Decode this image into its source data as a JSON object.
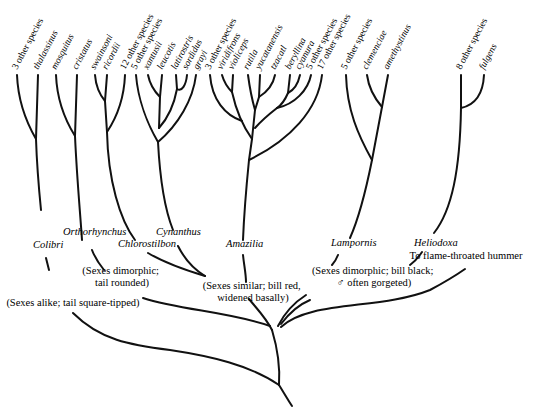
{
  "diagram": {
    "type": "phylogenetic-tree",
    "tips": [
      {
        "label": "3 other species",
        "italic": false,
        "x": 17
      },
      {
        "label": "thalassinus",
        "italic": true,
        "x": 38
      },
      {
        "label": "mosquitus",
        "italic": true,
        "x": 56
      },
      {
        "label": "cristatus",
        "italic": true,
        "x": 77
      },
      {
        "label": "swainsoni",
        "italic": true,
        "x": 95
      },
      {
        "label": "ricordii",
        "italic": true,
        "x": 107
      },
      {
        "label": "12 other species",
        "italic": false,
        "x": 125
      },
      {
        "label": "5 other species",
        "italic": false,
        "x": 136
      },
      {
        "label": "xantusii",
        "italic": true,
        "x": 148
      },
      {
        "label": "leucotis",
        "italic": true,
        "x": 162
      },
      {
        "label": "latirostris",
        "italic": true,
        "x": 176
      },
      {
        "label": "sordidus",
        "italic": true,
        "x": 187
      },
      {
        "label": "grayi",
        "italic": true,
        "x": 198
      },
      {
        "label": "3 other species",
        "italic": false,
        "x": 210
      },
      {
        "label": "viridifrons",
        "italic": true,
        "x": 222
      },
      {
        "label": "violiceps",
        "italic": true,
        "x": 233
      },
      {
        "label": "rutila",
        "italic": true,
        "x": 248
      },
      {
        "label": "yucatanensis",
        "italic": true,
        "x": 260
      },
      {
        "label": "tzacatl",
        "italic": true,
        "x": 275
      },
      {
        "label": "beryllina",
        "italic": true,
        "x": 290
      },
      {
        "label": "cyanura",
        "italic": true,
        "x": 300
      },
      {
        "label": "5 other species",
        "italic": false,
        "x": 311
      },
      {
        "label": "17 other species",
        "italic": false,
        "x": 322
      },
      {
        "label": "5 other species",
        "italic": false,
        "x": 346
      },
      {
        "label": "clemenciae",
        "italic": true,
        "x": 367
      },
      {
        "label": "amethystinus",
        "italic": true,
        "x": 388
      },
      {
        "label": "8 other species",
        "italic": false,
        "x": 461
      },
      {
        "label": "fulgens",
        "italic": true,
        "x": 484
      }
    ],
    "genera": [
      {
        "label": "Colibri",
        "x": 33,
        "y": 248
      },
      {
        "label": "Orthorhynchus",
        "x": 63,
        "y": 235
      },
      {
        "label": "Chlorostilbon",
        "x": 118,
        "y": 247
      },
      {
        "label": "Cynanthus",
        "x": 156,
        "y": 235
      },
      {
        "label": "Amazilia",
        "x": 226,
        "y": 247
      },
      {
        "label": "Lampornis",
        "x": 331,
        "y": 246
      },
      {
        "label": "Heliodoxa",
        "x": 414,
        "y": 246
      }
    ],
    "notes": [
      {
        "lines": [
          "(Sexes dimorphic;",
          "tail rounded)"
        ],
        "x": 122,
        "y": 274
      },
      {
        "lines": [
          "(Sexes similar; bill red,",
          "widened basally)"
        ],
        "x": 253,
        "y": 289
      },
      {
        "lines": [
          "(Sexes dimorphic; bill black;",
          "♂ often gorgeted)"
        ],
        "x": 374,
        "y": 274
      },
      {
        "lines": [
          "(Sexes alike; tail square-tipped)"
        ],
        "x": 73,
        "y": 306
      },
      {
        "lines": [
          "To flame-throated hummer"
        ],
        "x": 466,
        "y": 259
      }
    ]
  }
}
